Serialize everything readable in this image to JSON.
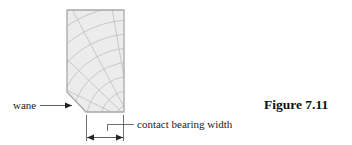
{
  "diagram": {
    "labels": {
      "wane": "wane",
      "contact_bearing_width": "contact bearing width",
      "figure_caption": "Figure 7.11"
    },
    "colors": {
      "section_fill": "#ececec",
      "section_outline": "#b0b0b0",
      "grain_lines": "#c4c4c4",
      "annotation_lines": "#333333"
    }
  }
}
